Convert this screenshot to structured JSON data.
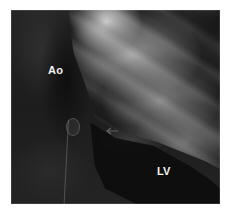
{
  "image": {
    "type": "angiogram",
    "colors": {
      "background": "#ffffff",
      "dark_region": "#1c1c1c",
      "bright_region": "#b9b9b9",
      "label": "#f2f2f2"
    },
    "labels": {
      "aorta": "Ao",
      "left_ventricle": "LV"
    }
  }
}
